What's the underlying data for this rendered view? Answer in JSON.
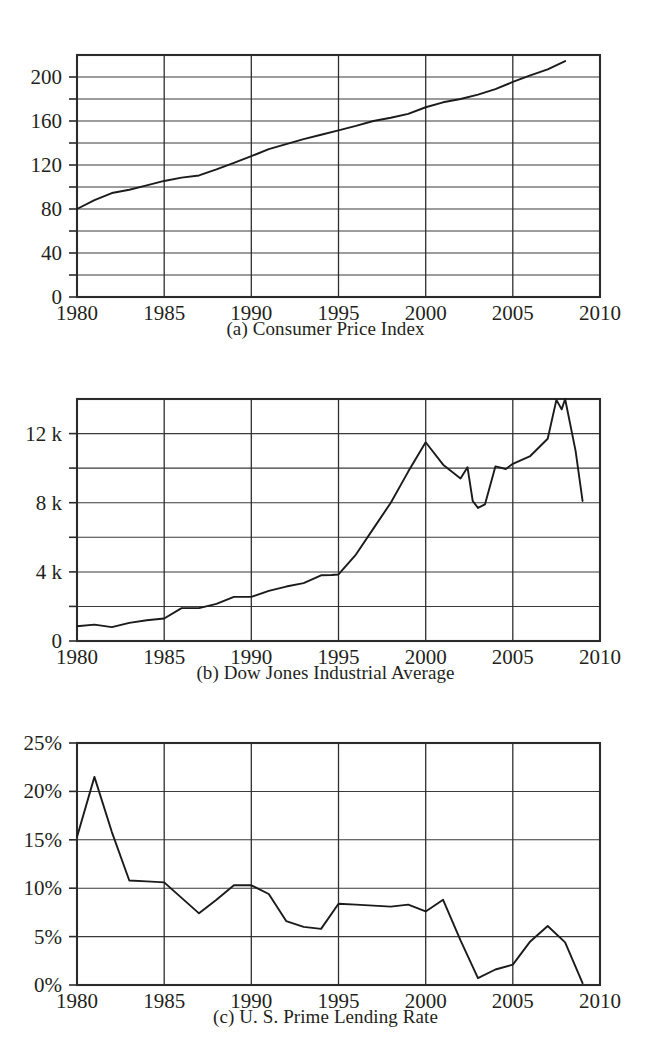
{
  "figure": {
    "background": "#ffffff",
    "line_color": "#1b1b1b",
    "grid_color": "#3a3a3a",
    "frame_color": "#2b2b2b"
  },
  "panels": [
    {
      "caption": "(a) Consumer Price Index"
    },
    {
      "caption": "(b) Dow Jones Industrial Average"
    },
    {
      "caption": "(c) U. S. Prime Lending Rate"
    }
  ],
  "chart_data": [
    {
      "type": "line",
      "title": "(a) Consumer Price Index",
      "xlabel": "",
      "ylabel": "",
      "xlim": [
        1980,
        2010
      ],
      "ylim": [
        0,
        220
      ],
      "grid": true,
      "legend": "none",
      "xticks": [
        1980,
        1985,
        1990,
        1995,
        2000,
        2005,
        2010
      ],
      "xtick_labels": [
        "1980",
        "1985",
        "1990",
        "1995",
        "2000",
        "2005",
        "2010"
      ],
      "yticks": [
        0,
        40,
        80,
        120,
        160,
        200
      ],
      "ytick_labels": [
        "0",
        "40",
        "80",
        "120",
        "160",
        "200"
      ],
      "y_gridline_step": 20,
      "x": [
        1980,
        1981,
        1982,
        1983,
        1984,
        1985,
        1986,
        1987,
        1988,
        1989,
        1990,
        1991,
        1992,
        1993,
        1994,
        1995,
        1996,
        1997,
        1998,
        1999,
        2000,
        2001,
        2002,
        2003,
        2004,
        2005,
        2006,
        2007,
        2008
      ],
      "values": [
        80.0,
        88.0,
        94.5,
        97.5,
        101.5,
        105.5,
        108.5,
        110.5,
        116.0,
        122.0,
        128.0,
        134.5,
        139.0,
        143.5,
        147.5,
        151.5,
        155.5,
        160.0,
        163.0,
        166.5,
        172.5,
        177.0,
        180.0,
        184.0,
        189.0,
        195.5,
        201.5,
        207.0,
        214.5
      ]
    },
    {
      "type": "line",
      "title": "(b) Dow Jones Industrial Average",
      "xlabel": "",
      "ylabel": "",
      "xlim": [
        1980,
        2010
      ],
      "ylim": [
        0,
        14000
      ],
      "grid": true,
      "legend": "none",
      "xticks": [
        1980,
        1985,
        1990,
        1995,
        2000,
        2005,
        2010
      ],
      "xtick_labels": [
        "1980",
        "1985",
        "1990",
        "1995",
        "2000",
        "2005",
        "2010"
      ],
      "yticks": [
        0,
        4000,
        8000,
        12000
      ],
      "ytick_labels": [
        "0",
        "4 k",
        "8 k",
        "12 k"
      ],
      "y_gridline_step": 2000,
      "x": [
        1980,
        1981,
        1982,
        1983,
        1984,
        1985,
        1986,
        1987,
        1988,
        1989,
        1990,
        1991,
        1992,
        1993,
        1994,
        1994.6,
        1995,
        1996,
        1997,
        1998,
        1999,
        2000,
        2001,
        2002,
        2002.4,
        2002.7,
        2003,
        2003.4,
        2004,
        2004.6,
        2005,
        2006,
        2007,
        2007.5,
        2007.8,
        2008,
        2008.6,
        2009
      ],
      "values": [
        850,
        950,
        800,
        1050,
        1200,
        1300,
        1900,
        1900,
        2150,
        2550,
        2550,
        2900,
        3150,
        3350,
        3800,
        3820,
        3850,
        5000,
        6500,
        8000,
        9800,
        11500,
        10200,
        9400,
        10050,
        8100,
        7700,
        7900,
        10100,
        9950,
        10250,
        10700,
        11700,
        13950,
        13400,
        14000,
        11000,
        8100
      ]
    },
    {
      "type": "line",
      "title": "(c) U. S. Prime Lending Rate",
      "xlabel": "",
      "ylabel": "",
      "xlim": [
        1980,
        2010
      ],
      "ylim": [
        0,
        25
      ],
      "grid": true,
      "legend": "none",
      "units": "percent",
      "xticks": [
        1980,
        1985,
        1990,
        1995,
        2000,
        2005,
        2010
      ],
      "xtick_labels": [
        "1980",
        "1985",
        "1990",
        "1995",
        "2000",
        "2005",
        "2010"
      ],
      "yticks": [
        0,
        5,
        10,
        15,
        20,
        25
      ],
      "ytick_labels": [
        "0%",
        "5%",
        "10%",
        "15%",
        "20%",
        "25%"
      ],
      "y_gridline_step": 5,
      "x": [
        1980,
        1981,
        1982,
        1983,
        1984,
        1985,
        1986,
        1987,
        1988,
        1989,
        1990,
        1991,
        1992,
        1993,
        1994,
        1995,
        1996,
        1997,
        1998,
        1999,
        2000,
        2001,
        2002,
        2003,
        2004,
        2005,
        2006,
        2007,
        2008,
        2009
      ],
      "values": [
        15.3,
        21.5,
        15.8,
        10.8,
        10.7,
        10.6,
        9.0,
        7.4,
        8.8,
        10.3,
        10.3,
        9.4,
        6.6,
        6.0,
        5.8,
        8.4,
        8.3,
        8.2,
        8.1,
        8.3,
        7.6,
        8.8,
        4.6,
        0.7,
        1.6,
        2.1,
        4.5,
        6.1,
        4.4,
        0.2
      ]
    }
  ]
}
